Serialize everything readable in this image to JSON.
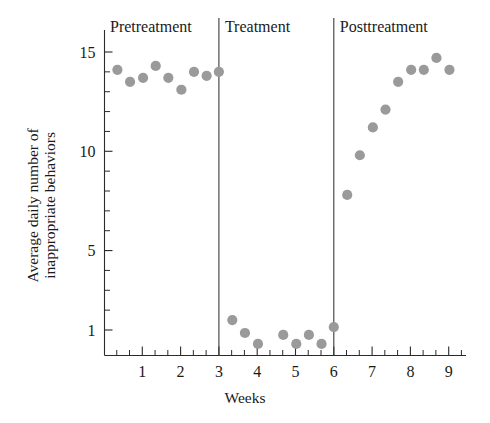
{
  "chart_data": {
    "type": "scatter",
    "title": "",
    "xlabel": "Weeks",
    "ylabel": "Average daily number of inappropriate behaviors",
    "ylabel_line1": "Average daily number of",
    "ylabel_line2": "inappropriate behaviors",
    "xlim": [
      0,
      9.4
    ],
    "ylim": [
      0,
      15.9
    ],
    "xticks": [
      1,
      2,
      3,
      4,
      5,
      6,
      7,
      8,
      9
    ],
    "xtick_labels": [
      "1",
      "2",
      "3",
      "4",
      "5",
      "6",
      "7",
      "8",
      "9"
    ],
    "yticks": [
      1,
      5,
      10,
      15
    ],
    "ytick_labels": [
      "1",
      "5",
      "10",
      "15"
    ],
    "y_minor_ticks": [
      2,
      3,
      4,
      6,
      7,
      8,
      9,
      11,
      12,
      13,
      14
    ],
    "x_minor_tick_step": 0.33,
    "grid": false,
    "legend": null,
    "marker_color": "#9a9a9a",
    "marker_size": 8,
    "phase_dividers": [
      3,
      6
    ],
    "phases": [
      {
        "name": "Pretreatment",
        "x_start": 0,
        "x_end": 3
      },
      {
        "name": "Treatment",
        "x_start": 3,
        "x_end": 6
      },
      {
        "name": "Posttreatment",
        "x_start": 6,
        "x_end": 9.4
      }
    ],
    "series": [
      {
        "name": "Average daily inappropriate behaviors",
        "points": [
          {
            "x": 0.35,
            "y": 14.1,
            "phase": "Pretreatment"
          },
          {
            "x": 0.68,
            "y": 13.5,
            "phase": "Pretreatment"
          },
          {
            "x": 1.02,
            "y": 13.7,
            "phase": "Pretreatment"
          },
          {
            "x": 1.35,
            "y": 14.3,
            "phase": "Pretreatment"
          },
          {
            "x": 1.68,
            "y": 13.7,
            "phase": "Pretreatment"
          },
          {
            "x": 2.02,
            "y": 13.1,
            "phase": "Pretreatment"
          },
          {
            "x": 2.35,
            "y": 14.0,
            "phase": "Pretreatment"
          },
          {
            "x": 2.68,
            "y": 13.8,
            "phase": "Pretreatment"
          },
          {
            "x": 3.0,
            "y": 14.0,
            "phase": "Pretreatment"
          },
          {
            "x": 3.35,
            "y": 1.5,
            "phase": "Treatment"
          },
          {
            "x": 3.68,
            "y": 0.85,
            "phase": "Treatment"
          },
          {
            "x": 4.02,
            "y": 0.3,
            "phase": "Treatment"
          },
          {
            "x": 4.68,
            "y": 0.75,
            "phase": "Treatment"
          },
          {
            "x": 5.02,
            "y": 0.3,
            "phase": "Treatment"
          },
          {
            "x": 5.35,
            "y": 0.75,
            "phase": "Treatment"
          },
          {
            "x": 5.68,
            "y": 0.3,
            "phase": "Treatment"
          },
          {
            "x": 6.0,
            "y": 1.15,
            "phase": "Treatment"
          },
          {
            "x": 6.35,
            "y": 7.8,
            "phase": "Posttreatment"
          },
          {
            "x": 6.68,
            "y": 9.8,
            "phase": "Posttreatment"
          },
          {
            "x": 7.02,
            "y": 11.2,
            "phase": "Posttreatment"
          },
          {
            "x": 7.35,
            "y": 12.1,
            "phase": "Posttreatment"
          },
          {
            "x": 7.68,
            "y": 13.5,
            "phase": "Posttreatment"
          },
          {
            "x": 8.02,
            "y": 14.1,
            "phase": "Posttreatment"
          },
          {
            "x": 8.35,
            "y": 14.1,
            "phase": "Posttreatment"
          },
          {
            "x": 8.68,
            "y": 14.7,
            "phase": "Posttreatment"
          },
          {
            "x": 9.02,
            "y": 14.1,
            "phase": "Posttreatment"
          }
        ]
      }
    ]
  },
  "phase_headers": {
    "pretreatment": "Pretreatment",
    "treatment": "Treatment",
    "posttreatment": "Posttreatment"
  },
  "axes": {
    "y_title_line1": "Average daily number of",
    "y_title_line2": "inappropriate behaviors",
    "x_title": "Weeks",
    "y_labels": [
      "15",
      "10",
      "5",
      "1"
    ],
    "x_labels": [
      "1",
      "2",
      "3",
      "4",
      "5",
      "6",
      "7",
      "8",
      "9"
    ]
  }
}
